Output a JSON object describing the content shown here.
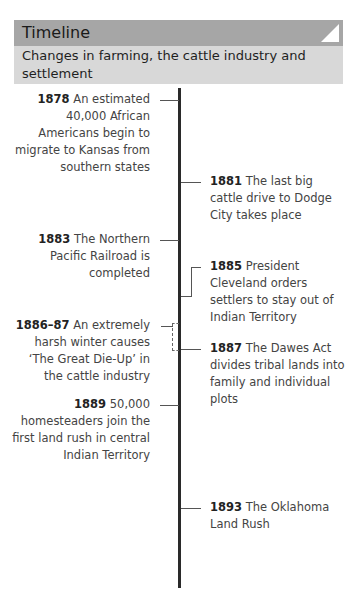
{
  "header": {
    "title": "Timeline",
    "subtitle": "Changes in farming, the cattle industry and settlement"
  },
  "events": [
    {
      "year": "1878",
      "text": " An estimated 40,000 African Americans begin to migrate to Kansas from southern states",
      "side": "left"
    },
    {
      "year": "1881",
      "text": " The last big cattle drive to Dodge City takes place",
      "side": "right"
    },
    {
      "year": "1883",
      "text": " The Northern Pacific Railroad is completed",
      "side": "left"
    },
    {
      "year": "1885",
      "text": " President Cleveland orders settlers to stay out of Indian Territory",
      "side": "right"
    },
    {
      "year": "1886–87",
      "text": " An extremely harsh winter causes ‘The Great Die-Up’ in the cattle industry",
      "side": "left"
    },
    {
      "year": "1887",
      "text": " The Dawes Act divides tribal lands into family and individual plots",
      "side": "right"
    },
    {
      "year": "1889",
      "text": " 50,000 homesteaders join the first land rush in central Indian Territory",
      "side": "left"
    },
    {
      "year": "1893",
      "text": " The Oklahoma Land Rush",
      "side": "right"
    }
  ],
  "colors": {
    "header_bg": "#a6a6a6",
    "subheader_bg": "#d8d8d8",
    "axis": "#2a2a2a"
  }
}
